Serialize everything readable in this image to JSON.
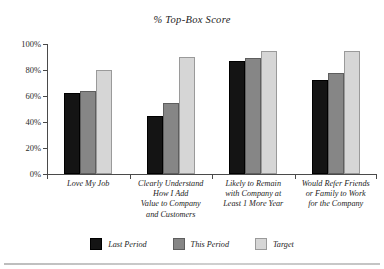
{
  "chart_data": {
    "type": "bar",
    "title": "%  Top-Box Score",
    "xlabel": "",
    "ylabel": "",
    "ylim": [
      0,
      100
    ],
    "ytick_labels": [
      "100%",
      "80%",
      "60%",
      "40%",
      "20%",
      "0%"
    ],
    "ytick_values": [
      100,
      80,
      60,
      40,
      20,
      0
    ],
    "grid": false,
    "legend_position": "bottom",
    "categories": [
      "Love My Job",
      "Clearly Understand How I Add Value to Company and Customers",
      "Likely to Remain with Company at Least 1 More Year",
      "Would Refer Friends or Family to Work for the Company"
    ],
    "category_lines": [
      [
        "Love My Job"
      ],
      [
        "Clearly Understand",
        "How I Add",
        "Value to Company",
        "and Customers"
      ],
      [
        "Likely to Remain",
        "with Company at",
        "Least 1 More Year"
      ],
      [
        "Would Refer Friends",
        "or Family to Work",
        "for the Company"
      ]
    ],
    "series": [
      {
        "name": "Last Period",
        "color": "#141414",
        "values": [
          62,
          45,
          87,
          72
        ]
      },
      {
        "name": "This Period",
        "color": "#868686",
        "values": [
          64,
          55,
          89,
          78
        ]
      },
      {
        "name": "Target",
        "color": "#d6d6d6",
        "values": [
          80,
          90,
          95,
          95
        ]
      }
    ]
  },
  "legend": {
    "items": [
      {
        "label": "Last Period"
      },
      {
        "label": "This Period"
      },
      {
        "label": "Target"
      }
    ]
  }
}
